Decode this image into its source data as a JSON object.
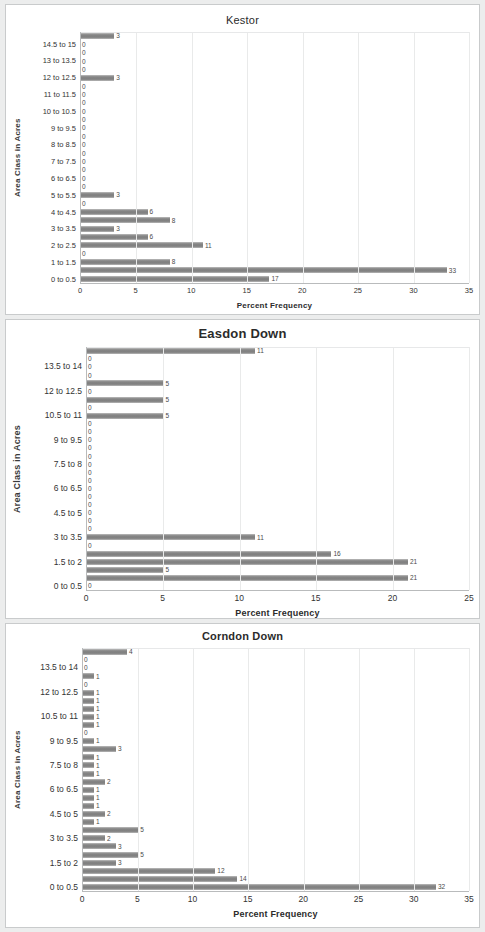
{
  "page": {
    "background": "#eceded",
    "panel_background": "#ffffff",
    "bar_color": "#868686"
  },
  "charts": [
    {
      "id": "kestor",
      "title": "Kestor",
      "xlabel": "Percent Frequency",
      "ylabel": "Area Class in Acres",
      "chart_data": {
        "type": "bar",
        "orientation": "horizontal",
        "title": "Kestor",
        "xlabel": "Percent Frequency",
        "ylabel": "Area Class in Acres",
        "xlim": [
          0,
          35
        ],
        "xticks": [
          0,
          5,
          10,
          15,
          20,
          25,
          30,
          35
        ],
        "grid": true,
        "legend": false,
        "categories": [
          "0 to 0.5",
          "0.5 to 1",
          "1 to 1.5",
          "1.5 to 2",
          "2 to 2.5",
          "2.5 to 3",
          "3 to 3.5",
          "3.5 to 4",
          "4 to 4.5",
          "4.5 to 5",
          "5 to 5.5",
          "5.5 to 6",
          "6 to 6.5",
          "6.5 to 7",
          "7 to 7.5",
          "7.5 to 8",
          "8 to 8.5",
          "8.5 to 9",
          "9 to 9.5",
          "9.5 to 10",
          "10 to 10.5",
          "10.5 to 11",
          "11 to 11.5",
          "11.5 to 12",
          "12 to 12.5",
          "12.5 to 13",
          "13 to 13.5",
          "13.5 to 14",
          "14.5 to 15",
          "15 to 15.5"
        ],
        "visible_tick_labels": [
          "0 to 0.5",
          "1 to 1.5",
          "2 to 2.5",
          "3 to 3.5",
          "4 to 4.5",
          "5 to 5.5",
          "6 to 6.5",
          "7 to 7.5",
          "8 to 8.5",
          "9 to 9.5",
          "10 to 10.5",
          "11 to 11.5",
          "12 to 12.5",
          "13 to 13.5",
          "14.5 to 15"
        ],
        "values": [
          17,
          33,
          8,
          0,
          11,
          6,
          3,
          8,
          6,
          0,
          3,
          0,
          0,
          0,
          0,
          0,
          0,
          0,
          0,
          0,
          0,
          0,
          0,
          0,
          3,
          0,
          0,
          0,
          0,
          3
        ],
        "labels": [
          "17",
          "33",
          "8",
          "0",
          "11",
          "6",
          "3",
          "8",
          "6",
          "0",
          "3",
          "0",
          "0",
          "0",
          "0",
          "0",
          "0",
          "0",
          "0",
          "0",
          "0",
          "0",
          "0",
          "0",
          "3",
          "0",
          "0",
          "0",
          "0",
          "3"
        ]
      }
    },
    {
      "id": "easdon-down",
      "title": "Easdon Down",
      "xlabel": "Percent Frequency",
      "ylabel": "Area Class in Acres",
      "chart_data": {
        "type": "bar",
        "orientation": "horizontal",
        "title": "Easdon Down",
        "xlabel": "Percent Frequency",
        "ylabel": "Area Class in Acres",
        "xlim": [
          0,
          25
        ],
        "xticks": [
          0,
          5,
          10,
          15,
          20,
          25
        ],
        "grid": true,
        "legend": false,
        "categories": [
          "0 to 0.5",
          "0.5 to 1",
          "1 to 1.5",
          "1.5 to 2",
          "2 to 2.5",
          "2.5 to 3",
          "3 to 3.5",
          "3.5 to 4",
          "4 to 4.5",
          "4.5 to 5",
          "5 to 5.5",
          "5.5 to 6",
          "6 to 6.5",
          "6.5 to 7",
          "7 to 7.5",
          "7.5 to 8",
          "8 to 8.5",
          "8.5 to 9",
          "9 to 9.5",
          "9.5 to 10",
          "10 to 10.5",
          "10.5 to 11",
          "11 to 11.5",
          "11.5 to 12",
          "12 to 12.5",
          "12.5 to 13",
          "13 to 13.5",
          "13.5 to 14",
          "14 to 14.5",
          "14.5 to 15"
        ],
        "visible_tick_labels": [
          "0 to 0.5",
          "1.5 to 2",
          "3 to 3.5",
          "4.5 to 5",
          "6 to 6.5",
          "7.5 to 8",
          "9 to 9.5",
          "10.5 to 11",
          "12 to 12.5",
          "13.5 to 14"
        ],
        "values": [
          0,
          21,
          5,
          21,
          16,
          0,
          11,
          0,
          0,
          0,
          0,
          0,
          0,
          0,
          0,
          0,
          0,
          0,
          0,
          0,
          0,
          5,
          0,
          5,
          0,
          5,
          0,
          0,
          0,
          11
        ],
        "labels": [
          "0",
          "21",
          "5",
          "21",
          "16",
          "0",
          "11",
          "0",
          "0",
          "0",
          "0",
          "0",
          "0",
          "0",
          "0",
          "0",
          "0",
          "0",
          "0",
          "0",
          "0",
          "5",
          "0",
          "5",
          "0",
          "5",
          "0",
          "0",
          "0",
          "11"
        ]
      }
    },
    {
      "id": "corndon-down",
      "title": "Corndon Down",
      "xlabel": "Percent Frequency",
      "ylabel": "Area Class in Acres",
      "chart_data": {
        "type": "bar",
        "orientation": "horizontal",
        "title": "Corndon Down",
        "xlabel": "Percent Frequency",
        "ylabel": "Area Class in Acres",
        "xlim": [
          0,
          35
        ],
        "xticks": [
          0,
          5,
          10,
          15,
          20,
          25,
          30,
          35
        ],
        "grid": true,
        "legend": false,
        "categories": [
          "0 to 0.5",
          "0.5 to 1",
          "1 to 1.5",
          "1.5 to 2",
          "2 to 2.5",
          "2.5 to 3",
          "3 to 3.5",
          "3.5 to 4",
          "4 to 4.5",
          "4.5 to 5",
          "5 to 5.5",
          "5.5 to 6",
          "6 to 6.5",
          "6.5 to 7",
          "7 to 7.5",
          "7.5 to 8",
          "8 to 8.5",
          "8.5 to 9",
          "9 to 9.5",
          "9.5 to 10",
          "10 to 10.5",
          "10.5 to 11",
          "11 to 11.5",
          "11.5 to 12",
          "12 to 12.5",
          "12.5 to 13",
          "13 to 13.5",
          "13.5 to 14",
          "14 to 14.5",
          "14.5 to 15"
        ],
        "visible_tick_labels": [
          "0 to 0.5",
          "1.5 to 2",
          "3 to 3.5",
          "4.5 to 5",
          "6 to 6.5",
          "7.5 to 8",
          "9 to 9.5",
          "10.5 to 11",
          "12 to 12.5",
          "13.5 to 14"
        ],
        "values": [
          32,
          14,
          12,
          3,
          5,
          3,
          2,
          5,
          1,
          2,
          1,
          1,
          1,
          2,
          1,
          1,
          1,
          3,
          1,
          0,
          1,
          1,
          1,
          1,
          1,
          0,
          1,
          0,
          0,
          4
        ],
        "labels": [
          "32",
          "14",
          "12",
          "3",
          "5",
          "3",
          "2",
          "5",
          "1",
          "2",
          "1",
          "1",
          "1",
          "2",
          "1",
          "1",
          "1",
          "3",
          "1",
          "0",
          "1",
          "1",
          "1",
          "1",
          "1",
          "0",
          "1",
          "0",
          "0",
          "4"
        ]
      }
    }
  ]
}
